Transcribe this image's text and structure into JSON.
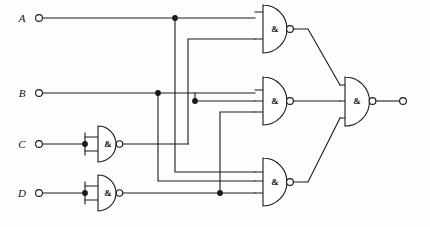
{
  "diagram": {
    "type": "digital-logic-schematic",
    "gate_symbol_standard": "IEC rectangular-qualifier ampersand inside D-shape",
    "line_color": "#1a1a1a",
    "background_color": "#fdfdfb",
    "gate_label": "&"
  },
  "inputs": [
    {
      "id": "A",
      "label": "A",
      "y": 18
    },
    {
      "id": "B",
      "label": "B",
      "y": 93
    },
    {
      "id": "C",
      "label": "C",
      "y": 144
    },
    {
      "id": "D",
      "label": "D",
      "y": 193
    }
  ],
  "output": {
    "id": "Y",
    "label": ""
  },
  "gates": [
    {
      "id": "g_c_inv",
      "kind": "NAND",
      "inputs": 1,
      "label": "&",
      "note": "inputs tied, acts as inverter on C"
    },
    {
      "id": "g_d_inv",
      "kind": "NAND",
      "inputs": 1,
      "label": "&",
      "note": "inputs tied, acts as inverter on D"
    },
    {
      "id": "g_top",
      "kind": "NAND",
      "inputs": 2,
      "label": "&"
    },
    {
      "id": "g_mid",
      "kind": "NAND",
      "inputs": 3,
      "label": "&"
    },
    {
      "id": "g_bot",
      "kind": "NAND",
      "inputs": 3,
      "label": "&"
    },
    {
      "id": "g_out",
      "kind": "NAND",
      "inputs": 3,
      "label": "&"
    }
  ],
  "junction_count": 6
}
